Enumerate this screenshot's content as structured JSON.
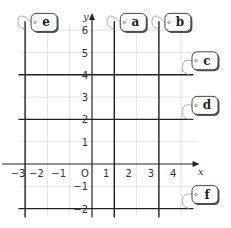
{
  "chart_data": {
    "type": "line",
    "title": "",
    "xlabel": "x",
    "ylabel": "y",
    "origin_label": "O",
    "xlim": [
      -3,
      5
    ],
    "ylim": [
      -2,
      6.5
    ],
    "grid": true,
    "x_ticks": [
      -3,
      -2,
      -1,
      1,
      2,
      3,
      4
    ],
    "y_ticks": [
      -2,
      -1,
      1,
      2,
      3,
      4,
      5,
      6
    ],
    "x_tick_labels": [
      "−3",
      "−2",
      "−1",
      "1",
      "2",
      "3",
      "4"
    ],
    "y_tick_labels": [
      "−2",
      "−1",
      "1",
      "2",
      "3",
      "4",
      "5",
      "6"
    ],
    "lines": [
      {
        "label": "a",
        "orientation": "vertical",
        "equation": "x = 1",
        "value": 1
      },
      {
        "label": "b",
        "orientation": "vertical",
        "equation": "x = 3",
        "value": 3
      },
      {
        "label": "c",
        "orientation": "horizontal",
        "equation": "y = 4",
        "value": 4
      },
      {
        "label": "d",
        "orientation": "horizontal",
        "equation": "y = 2",
        "value": 2
      },
      {
        "label": "e",
        "orientation": "vertical",
        "equation": "x = -3",
        "value": -3
      },
      {
        "label": "f",
        "orientation": "horizontal",
        "equation": "y = -2",
        "value": -2
      }
    ]
  }
}
